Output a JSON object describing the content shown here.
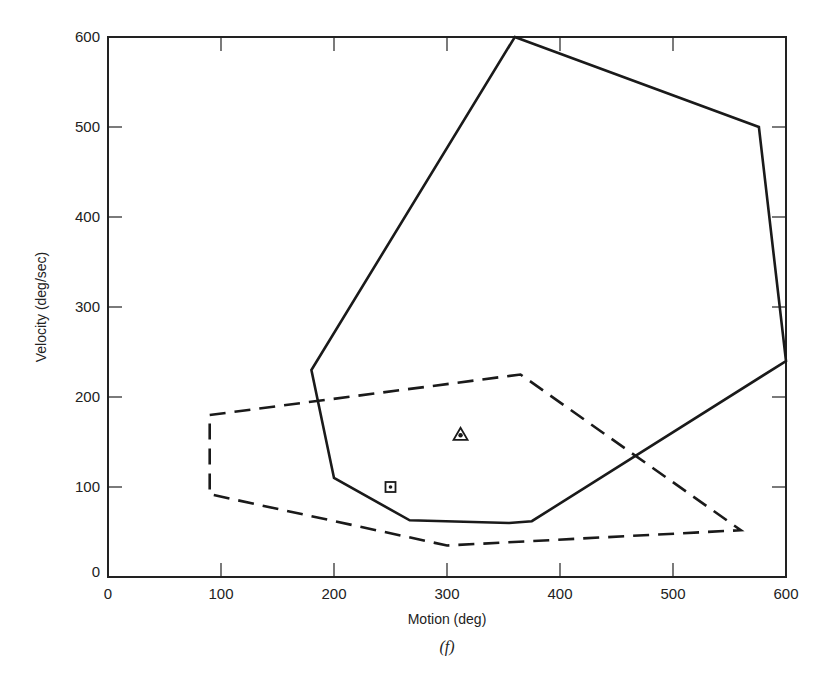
{
  "chart_data": {
    "type": "line",
    "title": "",
    "caption": "(f)",
    "xlabel": "Motion (deg)",
    "ylabel": "Velocity (deg/sec)",
    "xlim": [
      0,
      600
    ],
    "ylim": [
      0,
      600
    ],
    "x_ticks": [
      0,
      100,
      200,
      300,
      400,
      500,
      600
    ],
    "y_ticks": [
      0,
      100,
      200,
      300,
      400,
      500,
      600
    ],
    "x_tick_labels": [
      "0",
      "100",
      "200",
      "300",
      "400",
      "500",
      "600"
    ],
    "y_tick_labels": [
      "0",
      "100",
      "200",
      "300",
      "400",
      "500",
      "600"
    ],
    "grid": false,
    "series": [
      {
        "name": "solid-envelope",
        "style": "solid",
        "closed": true,
        "points": [
          [
            360,
            600
          ],
          [
            576,
            500
          ],
          [
            600,
            240
          ],
          [
            375,
            62
          ],
          [
            355,
            60
          ],
          [
            267,
            63
          ],
          [
            200,
            110
          ],
          [
            180,
            230
          ]
        ]
      },
      {
        "name": "dashed-envelope",
        "style": "dashed",
        "closed": true,
        "points": [
          [
            90,
            180
          ],
          [
            365,
            225
          ],
          [
            560,
            52
          ],
          [
            300,
            35
          ],
          [
            90,
            92
          ]
        ]
      }
    ],
    "markers": [
      {
        "name": "square-dot-marker",
        "shape": "square",
        "x": 250,
        "y": 100
      },
      {
        "name": "triangle-dot-marker",
        "shape": "triangle",
        "x": 312,
        "y": 158
      }
    ]
  }
}
